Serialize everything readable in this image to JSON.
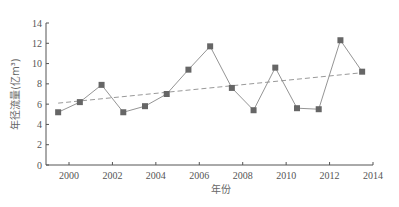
{
  "chart_data": {
    "type": "line",
    "title": "",
    "xlabel": "年份",
    "ylabel": "年径流量(亿m³)",
    "xlim": [
      1999.2,
      2014
    ],
    "ylim": [
      0,
      14
    ],
    "x_ticks": [
      2000,
      2002,
      2004,
      2006,
      2008,
      2010,
      2012,
      2014
    ],
    "y_ticks": [
      0,
      2,
      4,
      6,
      8,
      10,
      12,
      14
    ],
    "grid": false,
    "legend": null,
    "series": [
      {
        "name": "年径流量",
        "style": "solid line with square markers",
        "color": "#666666",
        "x": [
          1999.5,
          2000.5,
          2001.5,
          2002.5,
          2003.5,
          2004.5,
          2005.5,
          2006.5,
          2007.5,
          2008.5,
          2009.5,
          2010.5,
          2011.5,
          2012.5,
          2013.5
        ],
        "values": [
          5.2,
          6.2,
          7.9,
          5.2,
          5.8,
          7.0,
          9.4,
          11.7,
          7.6,
          5.4,
          9.6,
          5.6,
          5.5,
          12.3,
          9.2
        ]
      },
      {
        "name": "趋势线",
        "style": "dashed linear trend",
        "color": "#999999",
        "x": [
          1999.5,
          2013.5
        ],
        "values": [
          6.1,
          9.1
        ]
      }
    ]
  }
}
